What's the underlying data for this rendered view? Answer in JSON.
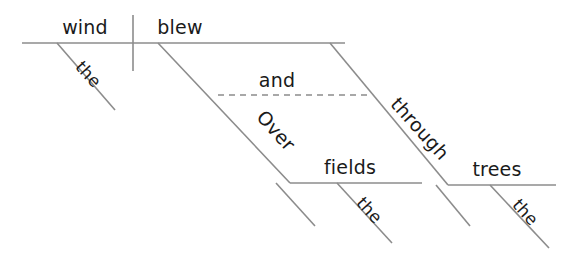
{
  "diagram": {
    "type": "reed-kellogg-sentence-diagram",
    "sentence": "The wind blew over the fields and through the trees.",
    "colors": {
      "line": "#8c8c8c",
      "text": "#1a1a1a",
      "background": "#ffffff"
    },
    "words": [
      {
        "id": "subject",
        "label": "wind",
        "role": "subject",
        "orientation": "horizontal",
        "x": 85,
        "y": 34,
        "anchor": "middle",
        "size": "large"
      },
      {
        "id": "verb",
        "label": "blew",
        "role": "verb",
        "orientation": "horizontal",
        "x": 180,
        "y": 34,
        "anchor": "middle",
        "size": "large"
      },
      {
        "id": "subject-article",
        "label": "the",
        "role": "article-modifier-of-subject",
        "orientation": "diagonal",
        "x": 84,
        "y": 78,
        "rotate": 48,
        "anchor": "middle",
        "size": "small"
      },
      {
        "id": "conjunction",
        "label": "and",
        "role": "coordinating-conjunction",
        "orientation": "horizontal",
        "x": 277,
        "y": 87,
        "anchor": "middle",
        "size": "large"
      },
      {
        "id": "preposition-1",
        "label": "Over",
        "role": "preposition",
        "orientation": "diagonal",
        "x": 271,
        "y": 135,
        "rotate": 48,
        "anchor": "middle",
        "size": "large"
      },
      {
        "id": "object-1",
        "label": "fields",
        "role": "object-of-preposition",
        "orientation": "horizontal",
        "x": 350,
        "y": 174,
        "anchor": "middle",
        "size": "large"
      },
      {
        "id": "object-1-article",
        "label": "the",
        "role": "article-modifier-of-object",
        "orientation": "diagonal",
        "x": 365,
        "y": 214,
        "rotate": 48,
        "anchor": "middle",
        "size": "small"
      },
      {
        "id": "preposition-2",
        "label": "through",
        "role": "preposition",
        "orientation": "diagonal",
        "x": 415,
        "y": 133,
        "rotate": 48,
        "anchor": "middle",
        "size": "large"
      },
      {
        "id": "object-2",
        "label": "trees",
        "role": "object-of-preposition",
        "orientation": "horizontal",
        "x": 497,
        "y": 176,
        "anchor": "middle",
        "size": "large"
      },
      {
        "id": "object-2-article",
        "label": "the",
        "role": "article-modifier-of-object",
        "orientation": "diagonal",
        "x": 521,
        "y": 216,
        "rotate": 48,
        "anchor": "middle",
        "size": "small"
      }
    ],
    "lines": [
      {
        "id": "main-baseline",
        "role": "subject-predicate-baseline",
        "style": "solid",
        "x1": 22,
        "y1": 43,
        "x2": 345,
        "y2": 43
      },
      {
        "id": "subject-verb-divider",
        "role": "vertical-divider",
        "style": "solid",
        "x1": 133,
        "y1": 15,
        "x2": 133,
        "y2": 71
      },
      {
        "id": "subject-article-slant",
        "role": "modifier-slant",
        "style": "solid",
        "x1": 57,
        "y1": 43,
        "x2": 115,
        "y2": 110
      },
      {
        "id": "conjunction-dashed",
        "role": "conjunction-connector",
        "style": "dashed",
        "x1": 218,
        "y1": 95,
        "x2": 369,
        "y2": 95
      },
      {
        "id": "preposition-1-slant",
        "role": "preposition-slant",
        "style": "solid",
        "x1": 158,
        "y1": 43,
        "x2": 290,
        "y2": 183
      },
      {
        "id": "preposition-1-slant-tail",
        "role": "preposition-slant-tail",
        "style": "solid",
        "x1": 276,
        "y1": 183,
        "x2": 315,
        "y2": 226
      },
      {
        "id": "object-1-baseline",
        "role": "object-baseline",
        "style": "solid",
        "x1": 290,
        "y1": 183,
        "x2": 422,
        "y2": 183
      },
      {
        "id": "object-1-article-slant",
        "role": "modifier-slant",
        "style": "solid",
        "x1": 337,
        "y1": 183,
        "x2": 392,
        "y2": 243
      },
      {
        "id": "preposition-2-slant",
        "role": "preposition-slant",
        "style": "solid",
        "x1": 330,
        "y1": 43,
        "x2": 448,
        "y2": 185
      },
      {
        "id": "preposition-2-slant-tail",
        "role": "preposition-slant-tail",
        "style": "solid",
        "x1": 436,
        "y1": 185,
        "x2": 470,
        "y2": 226
      },
      {
        "id": "object-2-baseline",
        "role": "object-baseline",
        "style": "solid",
        "x1": 448,
        "y1": 185,
        "x2": 556,
        "y2": 185
      },
      {
        "id": "object-2-article-slant",
        "role": "modifier-slant",
        "style": "solid",
        "x1": 490,
        "y1": 185,
        "x2": 549,
        "y2": 248
      }
    ]
  }
}
